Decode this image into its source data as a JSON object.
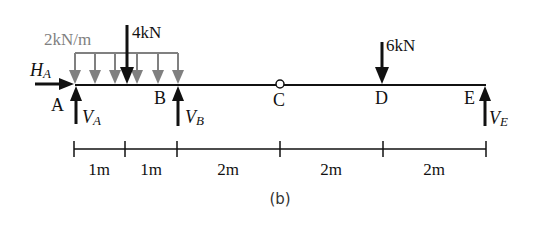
{
  "figure": {
    "caption": "(b)",
    "colors": {
      "ink": "#111111",
      "distributed_load": "#808080",
      "hinge_fill": "#ffffff"
    }
  },
  "loads": {
    "distributed": {
      "label": "2kN/m",
      "from": "A",
      "to": "B"
    },
    "point_4kN": {
      "label": "4kN"
    },
    "point_6kN": {
      "label": "6kN",
      "at": "D"
    }
  },
  "reactions": {
    "HA": {
      "main": "H",
      "sub": "A"
    },
    "VA": {
      "main": "V",
      "sub": "A"
    },
    "VB": {
      "main": "V",
      "sub": "B"
    },
    "VE": {
      "main": "V",
      "sub": "E"
    }
  },
  "points": {
    "A": "A",
    "B": "B",
    "C": "C",
    "D": "D",
    "E": "E"
  },
  "dimensions": [
    {
      "label": "1m"
    },
    {
      "label": "1m"
    },
    {
      "label": "2m"
    },
    {
      "label": "2m"
    },
    {
      "label": "2m"
    }
  ]
}
